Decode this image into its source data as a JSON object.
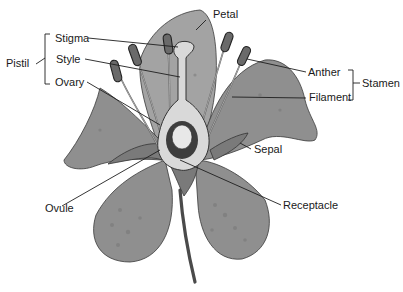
{
  "diagram": {
    "labels": {
      "petal": "Petal",
      "stigma": "Stigma",
      "style": "Style",
      "ovary": "Ovary",
      "pistil": "Pistil",
      "anther": "Anther",
      "filament": "Filament",
      "stamen": "Stamen",
      "sepal": "Sepal",
      "ovule": "Ovule",
      "receptacle": "Receptacle"
    },
    "groups": [
      {
        "name": "Pistil",
        "members": [
          "Stigma",
          "Style",
          "Ovary"
        ]
      },
      {
        "name": "Stamen",
        "members": [
          "Anther",
          "Filament"
        ]
      }
    ],
    "colors": {
      "background": "#ffffff",
      "petal": "#8f8f8f",
      "outline": "#3a3a3a",
      "pistil": "#d9d9d9",
      "text": "#1a1a1a"
    }
  }
}
